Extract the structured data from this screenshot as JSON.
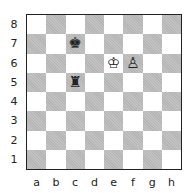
{
  "board": {
    "files": [
      "a",
      "b",
      "c",
      "d",
      "e",
      "f",
      "g",
      "h"
    ],
    "ranks": [
      "8",
      "7",
      "6",
      "5",
      "4",
      "3",
      "2",
      "1"
    ],
    "colors": {
      "light": "#ffffff",
      "dark": "#b5b5b5",
      "border": "#222222"
    },
    "pieces": [
      {
        "square": "c7",
        "piece": "king",
        "color": "black",
        "glyph": "♚"
      },
      {
        "square": "e6",
        "piece": "king",
        "color": "white",
        "glyph": "♔"
      },
      {
        "square": "f6",
        "piece": "pawn",
        "color": "white",
        "glyph": "♙"
      },
      {
        "square": "c5",
        "piece": "rook",
        "color": "black",
        "glyph": "♜"
      }
    ]
  }
}
